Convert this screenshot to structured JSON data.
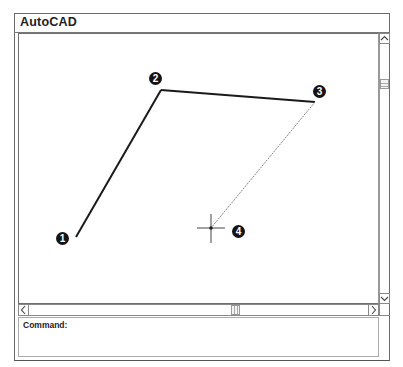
{
  "window": {
    "title": "AutoCAD"
  },
  "command_line": {
    "label": "Command:",
    "value": ""
  },
  "scrollbars": {
    "vertical": {
      "up_icon": "chevron-up",
      "down_icon": "chevron-down"
    },
    "horizontal": {
      "left_icon": "chevron-left",
      "right_icon": "chevron-right"
    }
  },
  "drawing": {
    "line_color": "#1a1a1a",
    "rubberband_color": "#666666",
    "points": [
      {
        "id": "1",
        "label": "1",
        "x": 76,
        "y": 237,
        "label_x": 62,
        "label_y": 232
      },
      {
        "id": "2",
        "label": "2",
        "x": 161,
        "y": 90,
        "label_x": 148,
        "label_y": 72
      },
      {
        "id": "3",
        "label": "3",
        "x": 315,
        "y": 102,
        "label_x": 312,
        "label_y": 85
      },
      {
        "id": "4",
        "label": "4",
        "x": 211,
        "y": 228,
        "label_x": 231,
        "label_y": 225
      }
    ],
    "segments": [
      {
        "from": "1",
        "to": "2",
        "style": "solid"
      },
      {
        "from": "2",
        "to": "3",
        "style": "solid"
      },
      {
        "from": "3",
        "to": "4",
        "style": "rubberband"
      }
    ],
    "cursor": {
      "type": "crosshair",
      "x": 211,
      "y": 228
    }
  }
}
